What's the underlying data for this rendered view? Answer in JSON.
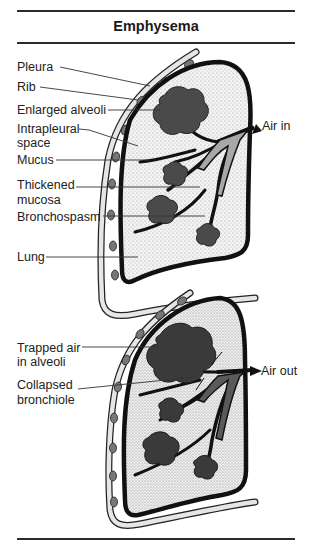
{
  "figure": {
    "title": "Emphysema"
  },
  "panel_inhale": {
    "labels": {
      "pleura": "Pleura",
      "rib": "Rib",
      "enlarged_alveoli": "Enlarged alveoli",
      "intrapleural_line1": "Intrapleural",
      "intrapleural_line2": "space",
      "mucus": "Mucus",
      "thickened_line1": "Thickened",
      "thickened_line2": "mucosa",
      "bronchospasm": "Bronchospasm",
      "lung": "Lung",
      "air_in": "Air in"
    }
  },
  "panel_exhale": {
    "labels": {
      "trapped_line1": "Trapped air",
      "trapped_line2": "in alveoli",
      "collapsed_line1": "Collapsed",
      "collapsed_line2": "bronchiole",
      "air_out": "Air out"
    }
  },
  "colors": {
    "outline": "#111111",
    "alveoli": "#4a4a4a",
    "rib": "#777777",
    "bronchi_fill": "#a8a8a8",
    "stipple": "#cfcfcf"
  }
}
